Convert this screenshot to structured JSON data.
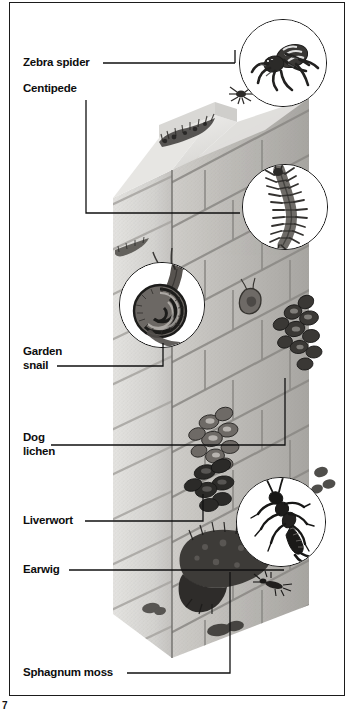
{
  "page": {
    "number": "7",
    "width": 357,
    "height": 717,
    "frame_color": "#1b1b1b",
    "background": "#ffffff"
  },
  "diagram": {
    "ink_color": "#111111"
  },
  "labels": [
    {
      "id": "zebra-spider",
      "text": "Zebra spider",
      "x": 23,
      "y": 56,
      "leader": {
        "from_x": 103,
        "from_y": 63,
        "to_x": 232,
        "to_y": 63,
        "elbow": "up",
        "elbow_y": 52
      }
    },
    {
      "id": "centipede",
      "text": "Centipede",
      "x": 23,
      "y": 84,
      "leader": {
        "from_x": 86,
        "from_y": 100,
        "to_x": 233,
        "to_y": 213,
        "elbow": "down"
      }
    },
    {
      "id": "garden-snail",
      "text": "Garden\nsnail",
      "x": 23,
      "y": 347,
      "leader": {
        "from_x": 58,
        "from_y": 366,
        "to_x": 163,
        "to_y": 344,
        "elbow": "up"
      }
    },
    {
      "id": "dog-lichen",
      "text": "Dog\nlichen",
      "x": 23,
      "y": 430,
      "leader": {
        "from_x": 52,
        "from_y": 445,
        "to_x": 285,
        "to_y": 378,
        "elbow": "up"
      }
    },
    {
      "id": "liverwort",
      "text": "Liverwort",
      "x": 23,
      "y": 513,
      "leader": {
        "from_x": 85,
        "from_y": 521,
        "to_x": 203,
        "to_y": 495,
        "elbow": "up"
      }
    },
    {
      "id": "earwig",
      "text": "Earwig",
      "x": 23,
      "y": 562,
      "leader": {
        "from_x": 70,
        "from_y": 570,
        "to_x": 282,
        "to_y": 570,
        "elbow": "none"
      }
    },
    {
      "id": "sphagnum-moss",
      "text": "Sphagnum moss",
      "x": 23,
      "y": 665,
      "leader": {
        "from_x": 128,
        "from_y": 673,
        "to_x": 230,
        "to_y": 573,
        "elbow": "up"
      }
    }
  ],
  "magnifiers": [
    {
      "id": "zebra-spider-inset",
      "subject": "zebra-spider",
      "cx": 283,
      "cy": 63,
      "r": 44
    },
    {
      "id": "centipede-inset",
      "subject": "centipede",
      "cx": 285,
      "cy": 207,
      "r": 43
    },
    {
      "id": "garden-snail-inset",
      "subject": "garden-snail",
      "cx": 162,
      "cy": 305,
      "r": 43
    },
    {
      "id": "earwig-inset",
      "subject": "earwig",
      "cx": 281,
      "cy": 522,
      "r": 45
    }
  ],
  "wall_organisms": [
    {
      "id": "spider-on-wall",
      "name": "zebra spider"
    },
    {
      "id": "centipede-on-wall",
      "name": "centipede"
    },
    {
      "id": "snail-on-wall",
      "name": "garden snail"
    },
    {
      "id": "snail-small-on-wall",
      "name": "garden snail"
    },
    {
      "id": "lichen-patch-upper",
      "name": "dog lichen"
    },
    {
      "id": "lichen-patch-lower",
      "name": "dog lichen"
    },
    {
      "id": "liverwort-patch",
      "name": "liverwort"
    },
    {
      "id": "moss-clump-top",
      "name": "sphagnum moss"
    },
    {
      "id": "moss-clump-bottom",
      "name": "sphagnum moss"
    },
    {
      "id": "earwig-on-wall",
      "name": "earwig"
    }
  ]
}
